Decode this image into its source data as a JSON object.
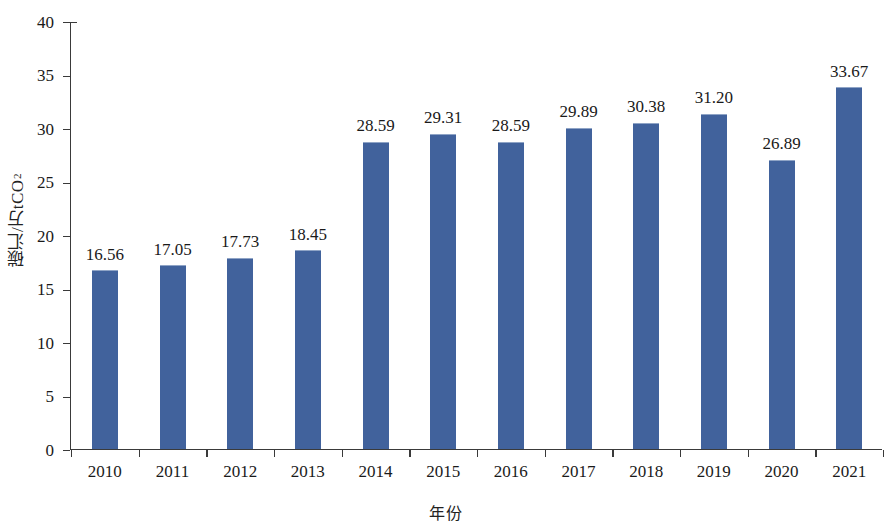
{
  "chart_data": {
    "type": "bar",
    "title": "",
    "xlabel": "年份",
    "ylabel": "碳汇/万tCO₂",
    "ylabel_main": "碳汇/万tCO",
    "ylabel_sub": "2",
    "categories": [
      "2010",
      "2011",
      "2012",
      "2013",
      "2014",
      "2015",
      "2016",
      "2017",
      "2018",
      "2019",
      "2020",
      "2021"
    ],
    "values": [
      16.56,
      17.05,
      17.73,
      18.45,
      28.59,
      29.31,
      28.59,
      29.89,
      30.38,
      31.2,
      26.89,
      33.67
    ],
    "value_labels": [
      "16.56",
      "17.05",
      "17.73",
      "18.45",
      "28.59",
      "29.31",
      "28.59",
      "29.89",
      "30.38",
      "31.20",
      "26.89",
      "33.67"
    ],
    "ylim": [
      0,
      40
    ],
    "yticks": [
      0,
      5,
      10,
      15,
      20,
      25,
      30,
      35,
      40
    ],
    "ytick_labels": [
      "0",
      "5",
      "10",
      "15",
      "20",
      "25",
      "30",
      "35",
      "40"
    ],
    "grid": false,
    "legend": false,
    "bar_color": "#41629c",
    "axis_color": "#3a3a3a",
    "text_color": "#1a1a1a"
  }
}
